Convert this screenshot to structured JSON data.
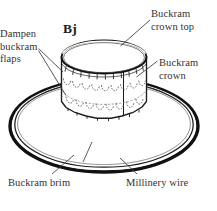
{
  "figure": {
    "title": "Bj",
    "background_color": "#ffffff",
    "ink_color": "#1c1c1c",
    "text_color": "#333333"
  },
  "labels": {
    "dampen_flaps": "Dampen\nbuckram\nflaps",
    "dampen_flaps_lines": [
      "Dampen",
      "buckram",
      "flaps"
    ],
    "crown_top": "Buckram\ncrown top",
    "crown_top_lines": [
      "Buckram",
      "crown top"
    ],
    "crown": "Buckram\ncrown",
    "crown_lines": [
      "Buckram",
      "crown"
    ],
    "brim": "Buckram brim",
    "wire": "Millinery wire"
  },
  "parts": {
    "crown_top_name": "buckram-crown-top",
    "crown_name": "buckram-crown",
    "flaps_name": "buckram-flaps",
    "brim_name": "buckram-brim",
    "wire_name": "millinery-wire"
  }
}
